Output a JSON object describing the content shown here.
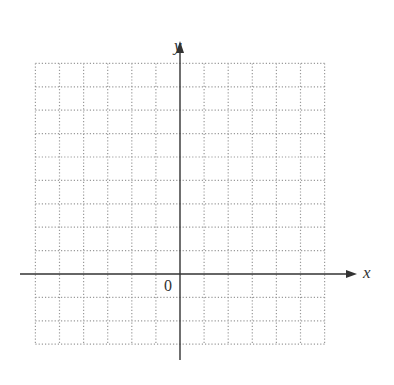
{
  "diagram": {
    "type": "coordinate-grid",
    "x_axis_label": "x",
    "y_axis_label": "y",
    "origin_label": "0",
    "grid": {
      "columns_left_of_origin": 6,
      "columns_right_of_origin": 6,
      "rows_above_origin": 9,
      "rows_below_origin": 3,
      "line_style": "dotted"
    },
    "colors": {
      "axis": "#333333",
      "grid": "#9a9a9a"
    }
  }
}
